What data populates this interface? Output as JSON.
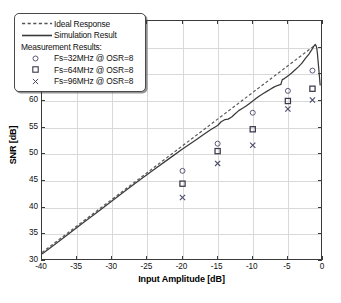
{
  "figure": {
    "background": "#ffffff",
    "frame_color": "#3a3a3a",
    "grid_color": "#d9d9d9"
  },
  "axes": {
    "x_title": "Input Amplitude [dB]",
    "y_title": "SNR [dB]",
    "x_ticks": [
      "-40",
      "-35",
      "-30",
      "-25",
      "-20",
      "-15",
      "-10",
      "-5",
      "0"
    ],
    "y_ticks": [
      "30",
      "35",
      "40",
      "45",
      "50",
      "55",
      "60",
      "65",
      "70",
      "75"
    ]
  },
  "legend": {
    "ideal_label": "Ideal Response",
    "simulation_label": "Simulation Result",
    "measurement_header": "Measurement Results:",
    "m1_label": "Fs=32MHz @ OSR=8",
    "m2_label": "Fs=64MHz @ OSR=8",
    "m3_label": "Fs=96MHz @ OSR=8"
  },
  "caption": "",
  "chart_data": {
    "type": "line",
    "title": "",
    "xlabel": "Input Amplitude [dB]",
    "ylabel": "SNR [dB]",
    "xlim": [
      -40,
      0
    ],
    "ylim": [
      30,
      75
    ],
    "xticks": [
      -40,
      -35,
      -30,
      -25,
      -20,
      -15,
      -10,
      -5,
      0
    ],
    "yticks": [
      30,
      35,
      40,
      45,
      50,
      55,
      60,
      65,
      70,
      75
    ],
    "grid": true,
    "legend_position": "upper-left",
    "series": [
      {
        "name": "Ideal Response",
        "style": "dashed",
        "color": "#555555",
        "x": [
          -40,
          -35,
          -30,
          -25,
          -20,
          -15,
          -10,
          -5,
          -2,
          -1
        ],
        "y": [
          31.6,
          36.6,
          41.6,
          46.6,
          51.6,
          56.6,
          61.6,
          66.6,
          69.6,
          70.6
        ]
      },
      {
        "name": "Simulation Result",
        "style": "solid",
        "color": "#3a3a3a",
        "x": [
          -40,
          -38,
          -36,
          -34,
          -32,
          -30,
          -28,
          -26,
          -24,
          -22,
          -20,
          -19,
          -18,
          -17,
          -16,
          -15,
          -14.5,
          -14,
          -13.5,
          -13,
          -12.5,
          -12,
          -11.5,
          -11,
          -10.5,
          -10,
          -9.5,
          -9,
          -8.5,
          -8,
          -7.5,
          -7,
          -6.5,
          -6,
          -5.8,
          -5.5,
          -5,
          -4.5,
          -4,
          -3.5,
          -3,
          -2.5,
          -2,
          -1.8,
          -1.5,
          -1.3,
          -1.1,
          -1.0,
          -0.9,
          -0.8,
          -0.6,
          -0.4
        ],
        "y": [
          31.3,
          33.3,
          35.3,
          37.3,
          39.3,
          41.3,
          43.3,
          45.3,
          47.2,
          49.1,
          51.0,
          51.9,
          52.8,
          53.7,
          54.6,
          55.4,
          56.1,
          56.5,
          56.6,
          57.0,
          57.6,
          58.2,
          58.6,
          59.0,
          59.5,
          60.0,
          60.5,
          61.0,
          61.4,
          61.8,
          62.2,
          62.6,
          62.9,
          63.1,
          64.0,
          64.2,
          64.7,
          65.2,
          65.8,
          66.4,
          67.1,
          68.0,
          68.8,
          69.2,
          69.8,
          70.3,
          70.6,
          70.4,
          70.0,
          69.0,
          66.0,
          62.9
        ]
      }
    ],
    "measurements": [
      {
        "name": "Fs=32MHz @ OSR=8",
        "marker": "circle",
        "color": "#4a4a6a",
        "points": [
          {
            "x": -20,
            "y": 46.9
          },
          {
            "x": -15,
            "y": 52.0
          },
          {
            "x": -10,
            "y": 57.8
          },
          {
            "x": -5,
            "y": 61.9
          },
          {
            "x": -1.5,
            "y": 65.7
          }
        ]
      },
      {
        "name": "Fs=64MHz @ OSR=8",
        "marker": "square",
        "color": "#3a3a4a",
        "points": [
          {
            "x": -20,
            "y": 44.5
          },
          {
            "x": -15,
            "y": 50.6
          },
          {
            "x": -10,
            "y": 54.7
          },
          {
            "x": -5,
            "y": 60.0
          },
          {
            "x": -1.5,
            "y": 62.3
          }
        ]
      },
      {
        "name": "Fs=96MHz @ OSR=8",
        "marker": "x",
        "color": "#4a4a6a",
        "points": [
          {
            "x": -20,
            "y": 41.9
          },
          {
            "x": -15,
            "y": 48.3
          },
          {
            "x": -10,
            "y": 51.7
          },
          {
            "x": -5,
            "y": 58.5
          },
          {
            "x": -1.5,
            "y": 60.2
          }
        ]
      }
    ]
  }
}
